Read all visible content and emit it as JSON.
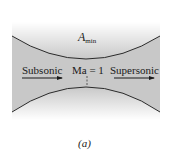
{
  "diagram": {
    "title_label": "A",
    "title_subscript": "min",
    "left_label": "Subsonic",
    "center_label": "Ma = 1",
    "right_label": "Supersonic",
    "caption": "(a)",
    "colors": {
      "fill": "#c8c8c8",
      "outline": "#2a2a2a",
      "text": "#1a1a1a"
    }
  }
}
